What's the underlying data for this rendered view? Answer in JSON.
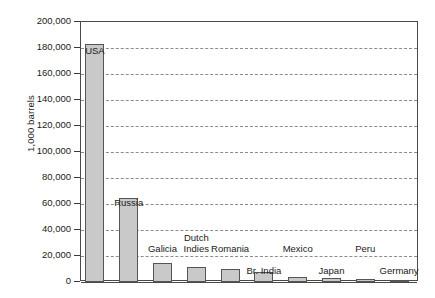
{
  "chart_data": {
    "type": "bar",
    "title": "",
    "subtitle": "",
    "xlabel": "",
    "ylabel": "1,000 barrels",
    "ylim": [
      0,
      200000
    ],
    "ytick_step": 20000,
    "grid": true,
    "legend": "none",
    "ytick_labels": [
      "200,000",
      "180,000",
      "160,000",
      "140,000",
      "120,000",
      "100,000",
      "80,000",
      "60,000",
      "40,000",
      "20,000",
      "0"
    ],
    "ytick_values": [
      200000,
      180000,
      160000,
      140000,
      120000,
      100000,
      80000,
      60000,
      40000,
      20000,
      0
    ],
    "categories": [
      "USA",
      "Russia",
      "Galicia",
      "Dutch Indies",
      "Romania",
      "Br. India",
      "Mexico",
      "Japan",
      "Peru",
      "Germany"
    ],
    "values": [
      183000,
      65000,
      15000,
      11500,
      10000,
      8000,
      4000,
      3000,
      2000,
      1500
    ],
    "bar_labels": [
      {
        "line1": "USA",
        "line2": ""
      },
      {
        "line1": "Russia",
        "line2": ""
      },
      {
        "line1": "Galicia",
        "line2": ""
      },
      {
        "line1": "Dutch",
        "line2": "Indies"
      },
      {
        "line1": "Romania",
        "line2": ""
      },
      {
        "line1": "Br. India",
        "line2": ""
      },
      {
        "line1": "Mexico",
        "line2": ""
      },
      {
        "line1": "Japan",
        "line2": ""
      },
      {
        "line1": "Peru",
        "line2": ""
      },
      {
        "line1": "Germany",
        "line2": ""
      }
    ],
    "colors": {
      "bar_fill": "#c9c9c9",
      "bar_stroke": "#555555",
      "gridline": "#8c8c8c",
      "axis": "#4a4a4a",
      "text": "#1a1a1a",
      "background": "#ffffff"
    }
  }
}
